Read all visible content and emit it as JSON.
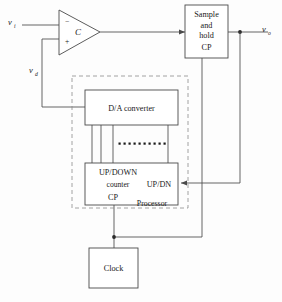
{
  "figure": {
    "type": "block-diagram",
    "width": 282,
    "height": 302,
    "background": "#fdfdfd",
    "line_color": "#4a4a4a",
    "dashed_color": "#8a8a8a",
    "text_color": "#1a1a1a"
  },
  "signals": {
    "input": {
      "label": "v",
      "subscript": "i"
    },
    "feedback": {
      "label": "v",
      "subscript": "d"
    },
    "output": {
      "label": "v",
      "subscript": "o"
    }
  },
  "comparator": {
    "name": "comparator",
    "symbol_label": "C",
    "inverting_input": "−",
    "noninverting_input": "+"
  },
  "blocks": [
    {
      "id": "sample-and-hold",
      "lines": [
        "Sample",
        "and",
        "hold",
        "CP"
      ]
    },
    {
      "id": "da-converter",
      "lines": [
        "D/A converter"
      ]
    },
    {
      "id": "up-down-counter",
      "lines": [
        "UP/DOWN",
        "counter",
        "CP"
      ],
      "port_label": "UP/DN"
    },
    {
      "id": "clock",
      "lines": [
        "Clock"
      ]
    }
  ],
  "processor": {
    "label": "Processor",
    "boundary": "dashed"
  },
  "bus": {
    "name": "parallel-digital-bus",
    "visible_lines": 4,
    "ellipsis_dot_count": 10
  }
}
